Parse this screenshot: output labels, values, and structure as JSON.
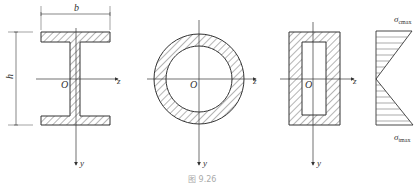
{
  "figure": {
    "caption": "图 9.26",
    "sections": [
      {
        "name": "I-section",
        "labels": {
          "width": "b",
          "height": "h",
          "origin": "O",
          "z_axis": "z",
          "y_axis": "y"
        }
      },
      {
        "name": "hollow-circular-section",
        "labels": {
          "origin": "O",
          "z_axis": "z",
          "y_axis": "y"
        }
      },
      {
        "name": "hollow-rectangular-section",
        "labels": {
          "origin": "O",
          "z_axis": "z",
          "y_axis": "y"
        }
      }
    ],
    "stress_diagram": {
      "top_label": "σ",
      "top_sub": "cmax",
      "bottom_label": "σ",
      "bottom_sub": "tmax"
    }
  }
}
